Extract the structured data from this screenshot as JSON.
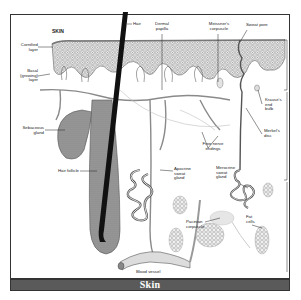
{
  "diagram": {
    "title": "SKIN",
    "caption": "Skin",
    "labels": {
      "hair": "Hair",
      "dermal_papilla": "Dermal\npapilla",
      "meissners_corpuscle": "Meissner's\ncorpuscle",
      "sweat_pore": "Sweat pore",
      "cornified_layer": "Cornified\nlayer",
      "basal_layer": "Basal\n(growing)\nlayer",
      "sebaceous_gland": "Sebaceous\ngland",
      "hair_follicle": "Hair follicle",
      "free_nerve_endings": "Free nerve\nendings",
      "krauses_end_bulb": "Krause's\nend\nbulb",
      "merkels_disc": "Merkel's\ndisc",
      "apocrine_sweat_gland": "Apocrine\nsweat\ngland",
      "merocrine_sweat_gland": "Merocrine\nsweat\ngland",
      "pacinian_corpuscle": "Pacinian\ncorpuscle",
      "fat_cells": "Fat\ncells",
      "blood_vessel": "Blood vessel"
    },
    "colors": {
      "caption_bar": "#5a5a5a",
      "epidermis": "#c9c9c9",
      "line": "#333333"
    }
  }
}
